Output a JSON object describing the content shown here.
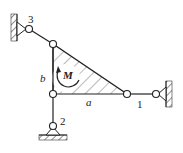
{
  "diagram": {
    "labels": {
      "joint1": "1",
      "joint2": "2",
      "joint3": "3",
      "side_a": "a",
      "side_b": "b",
      "moment": "M"
    },
    "colors": {
      "line": "#222222",
      "hatch": "#555555"
    }
  }
}
